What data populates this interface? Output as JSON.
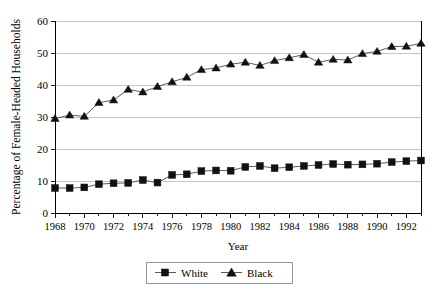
{
  "chart_data": {
    "type": "line",
    "title": "",
    "xlabel": "Year",
    "ylabel": "Percentage of Female-Headed Households",
    "xlim": [
      1968,
      1993
    ],
    "ylim": [
      0,
      60
    ],
    "yticks": [
      0,
      10,
      20,
      30,
      40,
      50,
      60
    ],
    "xticks_labeled": [
      1968,
      1970,
      1972,
      1974,
      1976,
      1978,
      1980,
      1982,
      1984,
      1986,
      1988,
      1990,
      1992
    ],
    "grid": "horizontal",
    "legend_position": "bottom-center",
    "x": [
      1968,
      1969,
      1970,
      1971,
      1972,
      1973,
      1974,
      1975,
      1976,
      1977,
      1978,
      1979,
      1980,
      1981,
      1982,
      1983,
      1984,
      1985,
      1986,
      1987,
      1988,
      1989,
      1990,
      1991,
      1992,
      1993
    ],
    "series": [
      {
        "name": "White",
        "marker": "square",
        "values": [
          7.8,
          7.8,
          8.0,
          9.0,
          9.3,
          9.4,
          10.3,
          9.5,
          11.9,
          12.1,
          13.1,
          13.3,
          13.2,
          14.4,
          14.7,
          14.0,
          14.3,
          14.7,
          15.0,
          15.3,
          15.1,
          15.2,
          15.4,
          15.9,
          16.2,
          16.4
        ]
      },
      {
        "name": "Black",
        "marker": "triangle",
        "values": [
          29.5,
          30.6,
          30.2,
          34.5,
          35.3,
          38.6,
          37.8,
          39.5,
          41.0,
          42.4,
          44.8,
          45.3,
          46.5,
          47.1,
          46.1,
          47.6,
          48.5,
          49.5,
          47.1,
          48.0,
          47.8,
          49.8,
          50.5,
          52.0,
          52.1,
          53.0
        ]
      }
    ],
    "ytick_labels": [
      "0",
      "10",
      "20",
      "30",
      "40",
      "50",
      "60"
    ],
    "xtick_labels": [
      "1968",
      "1970",
      "1972",
      "1974",
      "1976",
      "1978",
      "1980",
      "1982",
      "1984",
      "1986",
      "1988",
      "1990",
      "1992"
    ]
  },
  "legend": {
    "entries": [
      {
        "label": "White",
        "marker": "square-marker"
      },
      {
        "label": "Black",
        "marker": "triangle-marker"
      }
    ]
  },
  "colors": {
    "marker": "#111111",
    "line": "#4a4a4a",
    "grid": "#b9b9b9",
    "axis": "#000000",
    "background": "#ffffff"
  }
}
